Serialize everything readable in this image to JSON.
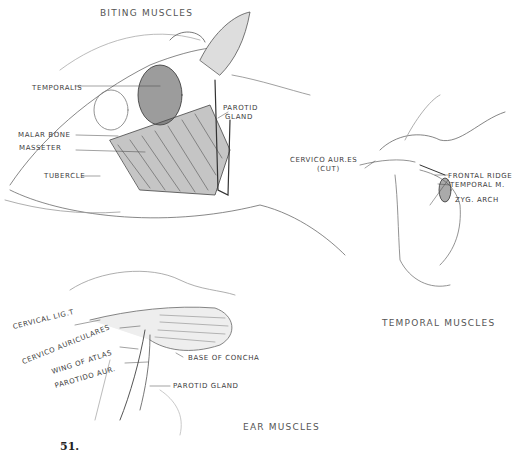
{
  "figure": {
    "number": "51.",
    "panels": [
      {
        "title": "BITING MUSCLES",
        "labels": [
          "TEMPORALIS",
          "MALAR BONE",
          "MASSETER",
          "TUBERCLE",
          "PAROTID",
          "GLAND"
        ]
      },
      {
        "title": "TEMPORAL MUSCLES",
        "labels": [
          "CERVICO AUR.ES",
          "(CUT)",
          "FRONTAL RIDGE",
          "TEMPORAL M.",
          "ZYG. ARCH"
        ]
      },
      {
        "title": "EAR MUSCLES",
        "labels": [
          "CERVICAL LIG.T",
          "CERVICO AURICULARES",
          "WING OF ATLAS",
          "PAROTIDO AUR.",
          "BASE OF CONCHA",
          "PAROTID GLAND"
        ]
      }
    ]
  }
}
